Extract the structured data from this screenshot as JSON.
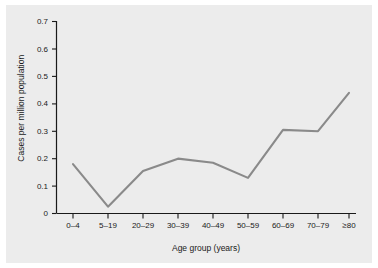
{
  "chart_data": {
    "type": "line",
    "title": "",
    "xlabel": "Age group (years)",
    "ylabel": "Cases per million population",
    "categories": [
      "0–4",
      "5–19",
      "20–29",
      "30–39",
      "40–49",
      "50–59",
      "60–69",
      "70–79",
      "≥80"
    ],
    "values": [
      0.18,
      0.025,
      0.155,
      0.2,
      0.185,
      0.13,
      0.305,
      0.3,
      0.44
    ],
    "series": [
      {
        "name": "Cases per million population",
        "values": [
          0.18,
          0.025,
          0.155,
          0.2,
          0.185,
          0.13,
          0.305,
          0.3,
          0.44
        ]
      }
    ],
    "ylim": [
      0,
      0.7
    ],
    "yticks": [
      "0",
      "0.1",
      "0.2",
      "0.3",
      "0.4",
      "0.5",
      "0.6",
      "0.7"
    ],
    "ytick_values": [
      0,
      0.1,
      0.2,
      0.3,
      0.4,
      0.5,
      0.6,
      0.7
    ],
    "grid": false,
    "legend": "none",
    "line_color": "#8a8a8a",
    "panel_color": "#ececec",
    "axis_color": "#1a1a1a",
    "figure_color": "#ffffff"
  }
}
